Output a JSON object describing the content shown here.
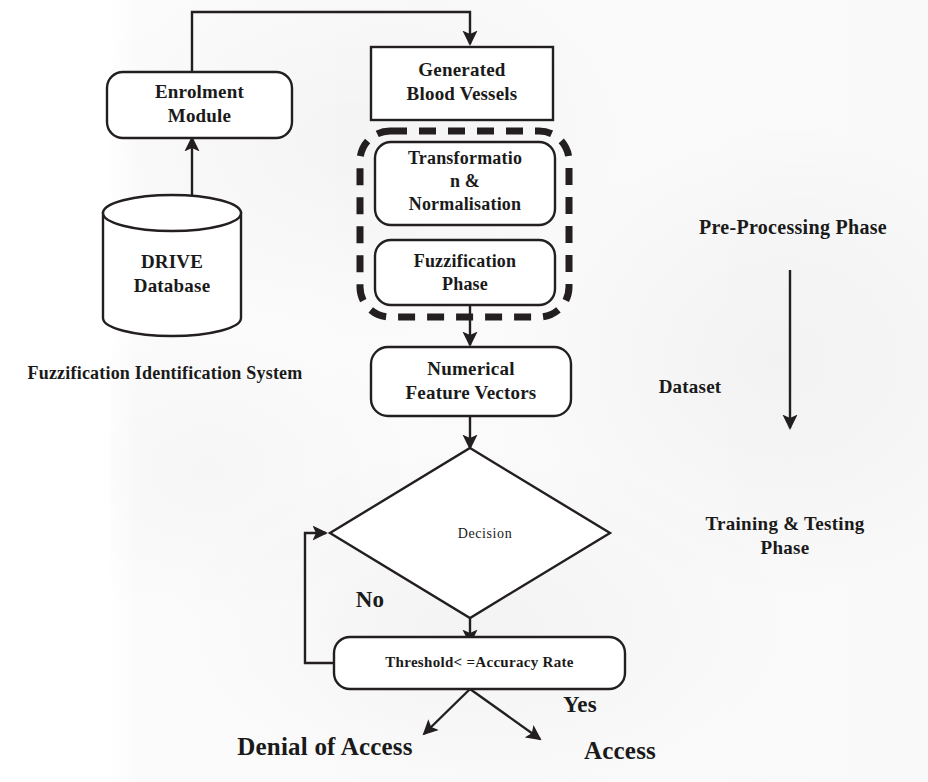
{
  "diagram": {
    "stroke_color": "#231f20",
    "background_color": "#ffffff"
  },
  "nodes": {
    "enrolment_module": {
      "label": "Enrolment\nModule",
      "shape": "rounded-rectangle"
    },
    "drive_database": {
      "label": "DRIVE\nDatabase",
      "shape": "cylinder"
    },
    "generated_blood_vessels": {
      "label": "Generated\nBlood Vessels",
      "shape": "rectangle"
    },
    "transformation_normalisation": {
      "label": "Transformatio\nn &\nNormalisation",
      "shape": "rounded-rectangle"
    },
    "fuzzification_phase": {
      "label": "Fuzzification\nPhase",
      "shape": "rounded-rectangle"
    },
    "numerical_feature_vectors": {
      "label": "Numerical\nFeature Vectors",
      "shape": "rounded-rectangle"
    },
    "decision": {
      "label": "Decision",
      "shape": "diamond"
    },
    "threshold": {
      "label": "Threshold< =Accuracy  Rate",
      "shape": "rounded-rectangle"
    }
  },
  "groups": {
    "preprocessing_group": {
      "label": "",
      "style": "dashed-rounded-rectangle"
    }
  },
  "annotations": {
    "system_caption": "Fuzzification Identification System",
    "dataset_caption": "Dataset",
    "preprocessing_phase": "Pre-Processing Phase",
    "training_testing_phase": "Training & Testing\nPhase"
  },
  "branches": {
    "no_label": "No",
    "yes_label": "Yes"
  },
  "outcomes": {
    "denial": "Denial of Access",
    "access": "Access"
  }
}
